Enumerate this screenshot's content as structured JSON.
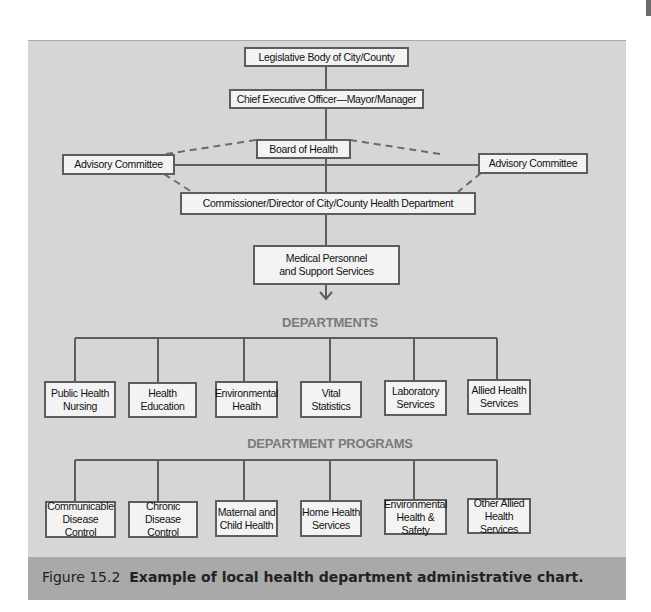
{
  "page_header_partial": "",
  "chart": {
    "top_nodes": {
      "legislative": "Legislative Body of City/County",
      "ceo": "Chief Executive Officer—Mayor/Manager",
      "board": "Board of Health",
      "advisory_left": "Advisory Committee",
      "advisory_right": "Advisory Committee",
      "commissioner": "Commissioner/Director of City/County Health Department",
      "medical_line1": "Medical Personnel",
      "medical_line2": "and Support Services"
    },
    "departments_heading": "DEPARTMENTS",
    "departments": [
      {
        "line1": "Public Health",
        "line2": "Nursing"
      },
      {
        "line1": "Health",
        "line2": "Education"
      },
      {
        "line1": "Environmental",
        "line2": "Health"
      },
      {
        "line1": "Vital",
        "line2": "Statistics"
      },
      {
        "line1": "Laboratory",
        "line2": "Services"
      },
      {
        "line1": "Allied Health",
        "line2": "Services"
      }
    ],
    "programs_heading": "DEPARTMENT PROGRAMS",
    "programs": [
      {
        "line1": "Communicable",
        "line2": "Disease Control"
      },
      {
        "line1": "Chronic",
        "line2": "Disease Control"
      },
      {
        "line1": "Maternal and",
        "line2": "Child Health"
      },
      {
        "line1": "Home Health",
        "line2": "Services"
      },
      {
        "line1": "Environmental",
        "line2": "Health & Safety"
      },
      {
        "line1": "Other Allied",
        "line2": "Health Services"
      }
    ]
  },
  "caption": {
    "label": "Figure 15.2",
    "text": "Example of local health department administrative chart."
  },
  "colors": {
    "panel": "#d6d6d6",
    "caption_band": "#a9a9a9",
    "box_fill": "#f3f3f3",
    "box_border": "#5d5d5d",
    "heading": "#7a7a7a"
  }
}
